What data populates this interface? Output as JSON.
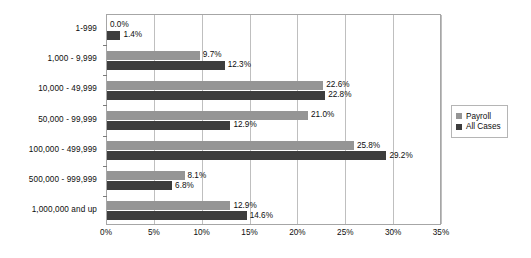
{
  "chart_data": {
    "type": "bar",
    "orientation": "horizontal",
    "title": "",
    "xlabel": "",
    "ylabel": "",
    "xlim": [
      0,
      35
    ],
    "xticks": [
      "0%",
      "5%",
      "10%",
      "15%",
      "20%",
      "25%",
      "30%",
      "35%"
    ],
    "xtick_values": [
      0,
      5,
      10,
      15,
      20,
      25,
      30,
      35
    ],
    "grid": true,
    "legend_position": "right",
    "categories": [
      "1-999",
      "1,000 - 9,999",
      "10,000 - 49,999",
      "50,000 - 99,999",
      "100,000 - 499,999",
      "500,000 - 999,999",
      "1,000,000 and up"
    ],
    "series": [
      {
        "name": "Payroll",
        "color": "#959595",
        "values": [
          0.0,
          9.7,
          22.6,
          21.0,
          25.8,
          8.1,
          12.9
        ],
        "labels": [
          "0.0%",
          "9.7%",
          "22.6%",
          "21.0%",
          "25.8%",
          "8.1%",
          "12.9%"
        ]
      },
      {
        "name": "All Cases",
        "color": "#3d3d3d",
        "values": [
          1.4,
          12.3,
          22.8,
          12.9,
          29.2,
          6.8,
          14.6
        ],
        "labels": [
          "1.4%",
          "12.3%",
          "22.8%",
          "12.9%",
          "29.2%",
          "6.8%",
          "14.6%"
        ]
      }
    ]
  },
  "legend": {
    "items": [
      {
        "label": "Payroll",
        "color": "#959595"
      },
      {
        "label": "All Cases",
        "color": "#3d3d3d"
      }
    ]
  },
  "colors": {
    "payroll": "#959595",
    "all_cases": "#3d3d3d",
    "gridline": "#bfbfbf",
    "axis": "#a6a6a6",
    "background": "#ffffff"
  }
}
